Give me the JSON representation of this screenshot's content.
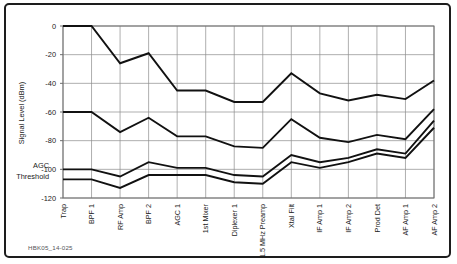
{
  "figure": {
    "caption": "HBK05_14-025",
    "frame_color": "#1d1d1d",
    "background": "#ffffff",
    "line_color": "#111111",
    "grid_color": "#8d8d8d"
  },
  "annotations": {
    "agc_line1": "AGC",
    "agc_line2": "Threshold",
    "agc_value": -105
  },
  "chart_data": {
    "type": "line",
    "title": "",
    "xlabel": "",
    "ylabel": "Signal Level (dBm)",
    "ylim": [
      -120,
      0
    ],
    "yticks": [
      0,
      -20,
      -40,
      -60,
      -80,
      -100,
      -120
    ],
    "ytick_labels": [
      "0",
      "-20",
      "-40",
      "-60",
      "-80",
      "-100",
      "-120"
    ],
    "grid": true,
    "legend": "none",
    "categories": [
      "Trap",
      "BPF 1",
      "RF Amp",
      "BPF 2",
      "AGC 1",
      "1st Mixer",
      "Diplexer 1",
      "1.5 MHz Preamp",
      "Xtal Filt",
      "IF Amp 1",
      "IF Amp 2",
      "Prod Det",
      "AF Amp 1",
      "AF Amp 2"
    ],
    "series": [
      {
        "name": "Strong signal level",
        "values": [
          0,
          0,
          -26,
          -19,
          -45,
          -45,
          -53,
          -53,
          -33,
          -47,
          -52,
          -48,
          -51,
          -38
        ]
      },
      {
        "name": "Moderate signal level",
        "values": [
          -60,
          -60,
          -74,
          -64,
          -77,
          -77,
          -84,
          -85,
          -65,
          -78,
          -81,
          -76,
          -79,
          -58
        ]
      },
      {
        "name": "Weak signal level",
        "values": [
          -100,
          -100,
          -105,
          -95,
          -99,
          -99,
          -104,
          -105,
          -90,
          -95,
          -92,
          -86,
          -89,
          -66
        ]
      },
      {
        "name": "AGC threshold level",
        "values": [
          -107,
          -107,
          -113,
          -104,
          -104,
          -104,
          -109,
          -110,
          -95,
          -99,
          -95,
          -89,
          -92,
          -71
        ]
      }
    ]
  }
}
